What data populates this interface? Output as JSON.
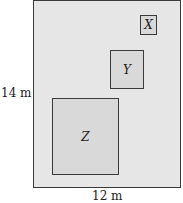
{
  "diagram": {
    "outer": {
      "width_label": "12 m",
      "height_label": "14 m",
      "fill": "#e6e6e6"
    },
    "squares": [
      {
        "label": "X",
        "fill": "#d9d9d9"
      },
      {
        "label": "Y",
        "fill": "#d9d9d9"
      },
      {
        "label": "Z",
        "fill": "#d9d9d9"
      }
    ]
  }
}
